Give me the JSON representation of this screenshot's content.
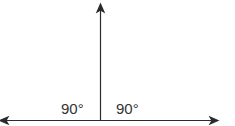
{
  "diagram": {
    "title": "",
    "angles": [
      {
        "label": "90°",
        "side": "left"
      },
      {
        "label": "90°",
        "side": "right"
      }
    ],
    "line_color": "#2a2a2a"
  }
}
